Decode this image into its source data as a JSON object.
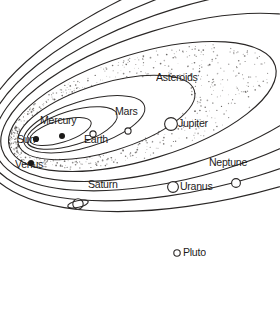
{
  "diagram": {
    "style": "hand-drawn line diagram of nested elliptical planetary orbits",
    "background_color": "#ffffff",
    "line_color": "#2a2726",
    "text_color": "#1e1c1b",
    "width": 280,
    "height": 321
  },
  "labels": {
    "sun": "Sun",
    "mercury": "Mercury",
    "venus": "Venus",
    "earth": "Earth",
    "mars": "Mars",
    "asteroids": "Asteroids",
    "jupiter": "Jupiter",
    "saturn": "Saturn",
    "uranus": "Uranus",
    "neptune": "Neptune",
    "pluto": "Pluto"
  },
  "bodies": [
    {
      "name": "sun",
      "label": "Sun",
      "marker": "filled-dot",
      "x": 36,
      "y": 139,
      "r": 3.1
    },
    {
      "name": "mercury",
      "label": "Mercury",
      "marker": "filled-dot",
      "x": 62,
      "y": 136,
      "r": 3.0
    },
    {
      "name": "venus",
      "label": "Venus",
      "marker": "filled-dot",
      "x": 31,
      "y": 163,
      "r": 3.0
    },
    {
      "name": "earth",
      "label": "Earth",
      "marker": "open-circle",
      "x": 93,
      "y": 134,
      "r": 3.1
    },
    {
      "name": "mars",
      "label": "Mars",
      "marker": "open-circle",
      "x": 128,
      "y": 131,
      "r": 3.1
    },
    {
      "name": "jupiter",
      "label": "Jupiter",
      "marker": "open-circle",
      "x": 171,
      "y": 124,
      "r": 6.4
    },
    {
      "name": "saturn",
      "label": "Saturn",
      "marker": "ringed-planet",
      "x": 78,
      "y": 204,
      "r": 5.4
    },
    {
      "name": "uranus",
      "label": "Uranus",
      "marker": "open-circle",
      "x": 173,
      "y": 187,
      "r": 5.4
    },
    {
      "name": "neptune",
      "label": "Neptune",
      "marker": "open-circle",
      "x": 236,
      "y": 183,
      "r": 4.4
    },
    {
      "name": "pluto",
      "label": "Pluto",
      "marker": "open-circle",
      "x": 177,
      "y": 253,
      "r": 3.2
    }
  ],
  "label_positions": [
    {
      "name": "mercury",
      "text": "Mercury",
      "x": 40,
      "y": 121
    },
    {
      "name": "sun",
      "text": "Sun",
      "x": 17,
      "y": 140
    },
    {
      "name": "venus",
      "text": "Venus",
      "x": 15,
      "y": 165
    },
    {
      "name": "earth",
      "text": "Earth",
      "x": 84,
      "y": 140
    },
    {
      "name": "mars",
      "text": "Mars",
      "x": 115,
      "y": 112
    },
    {
      "name": "asteroids",
      "text": "Asteroids",
      "x": 156,
      "y": 78
    },
    {
      "name": "jupiter",
      "text": "Jupiter",
      "x": 178,
      "y": 118
    },
    {
      "name": "saturn",
      "text": "Saturn",
      "x": 88,
      "y": 185
    },
    {
      "name": "uranus",
      "text": "Uranus",
      "x": 180,
      "y": 182
    },
    {
      "name": "neptune",
      "text": "Neptune",
      "x": 209,
      "y": 163
    },
    {
      "name": "pluto",
      "text": "Pluto",
      "x": 183,
      "y": 247
    }
  ],
  "orbits": [
    {
      "name": "mercury-orbit",
      "rx": 32,
      "ry": 11
    },
    {
      "name": "venus-orbit",
      "rx": 47,
      "ry": 17
    },
    {
      "name": "earth-orbit",
      "rx": 63,
      "ry": 23
    },
    {
      "name": "mars-orbit",
      "rx": 92,
      "ry": 34
    },
    {
      "name": "jupiter-orbit",
      "rx": 139,
      "ry": 53
    },
    {
      "name": "saturn-orbit",
      "rx": 178,
      "ry": 69
    },
    {
      "name": "uranus-orbit",
      "rx": 213,
      "ry": 84
    },
    {
      "name": "neptune-orbit",
      "rx": 252,
      "ry": 100
    },
    {
      "name": "pluto-orbit",
      "rx": 290,
      "ry": 117
    }
  ],
  "asteroid_belt": {
    "name": "asteroid-belt",
    "description": "stippled band of dots between Mars and Jupiter orbits"
  },
  "chart_data": {
    "type": "scatter",
    "xlabel": "",
    "ylabel": "",
    "categories": [
      "Sun",
      "Mercury",
      "Venus",
      "Earth",
      "Mars",
      "Asteroids",
      "Jupiter",
      "Saturn",
      "Uranus",
      "Neptune",
      "Pluto"
    ],
    "series": [
      {
        "name": "orbit semi-major axis (relative drawing units)",
        "values": [
          0,
          32,
          47,
          63,
          92,
          115,
          139,
          178,
          213,
          252,
          290
        ]
      },
      {
        "name": "orbit semi-minor axis (relative drawing units)",
        "values": [
          0,
          11,
          17,
          23,
          34,
          43,
          53,
          69,
          84,
          100,
          117
        ]
      }
    ],
    "legend": [],
    "grid": false,
    "annotations": [
      "Sun",
      "Mercury",
      "Venus",
      "Earth",
      "Mars",
      "Asteroids",
      "Jupiter",
      "Saturn",
      "Uranus",
      "Neptune",
      "Pluto"
    ]
  }
}
